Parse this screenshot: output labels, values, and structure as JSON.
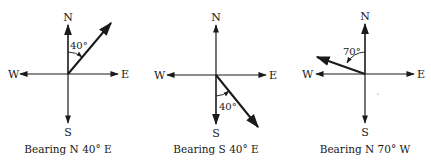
{
  "colors": {
    "ink": "#1a1a1a",
    "background": "#ffffff"
  },
  "compass_labels": {
    "north": "N",
    "south": "S",
    "east": "E",
    "west": "W"
  },
  "panels": [
    {
      "caption": "Bearing N 40° E",
      "angle_label": "40°",
      "reference": "N",
      "direction": "E",
      "degrees": 40
    },
    {
      "caption": "Bearing S 40° E",
      "angle_label": "40°",
      "reference": "S",
      "direction": "E",
      "degrees": 40
    },
    {
      "caption": "Bearing N 70° W",
      "angle_label": "70°",
      "reference": "N",
      "direction": "W",
      "degrees": 70
    }
  ]
}
